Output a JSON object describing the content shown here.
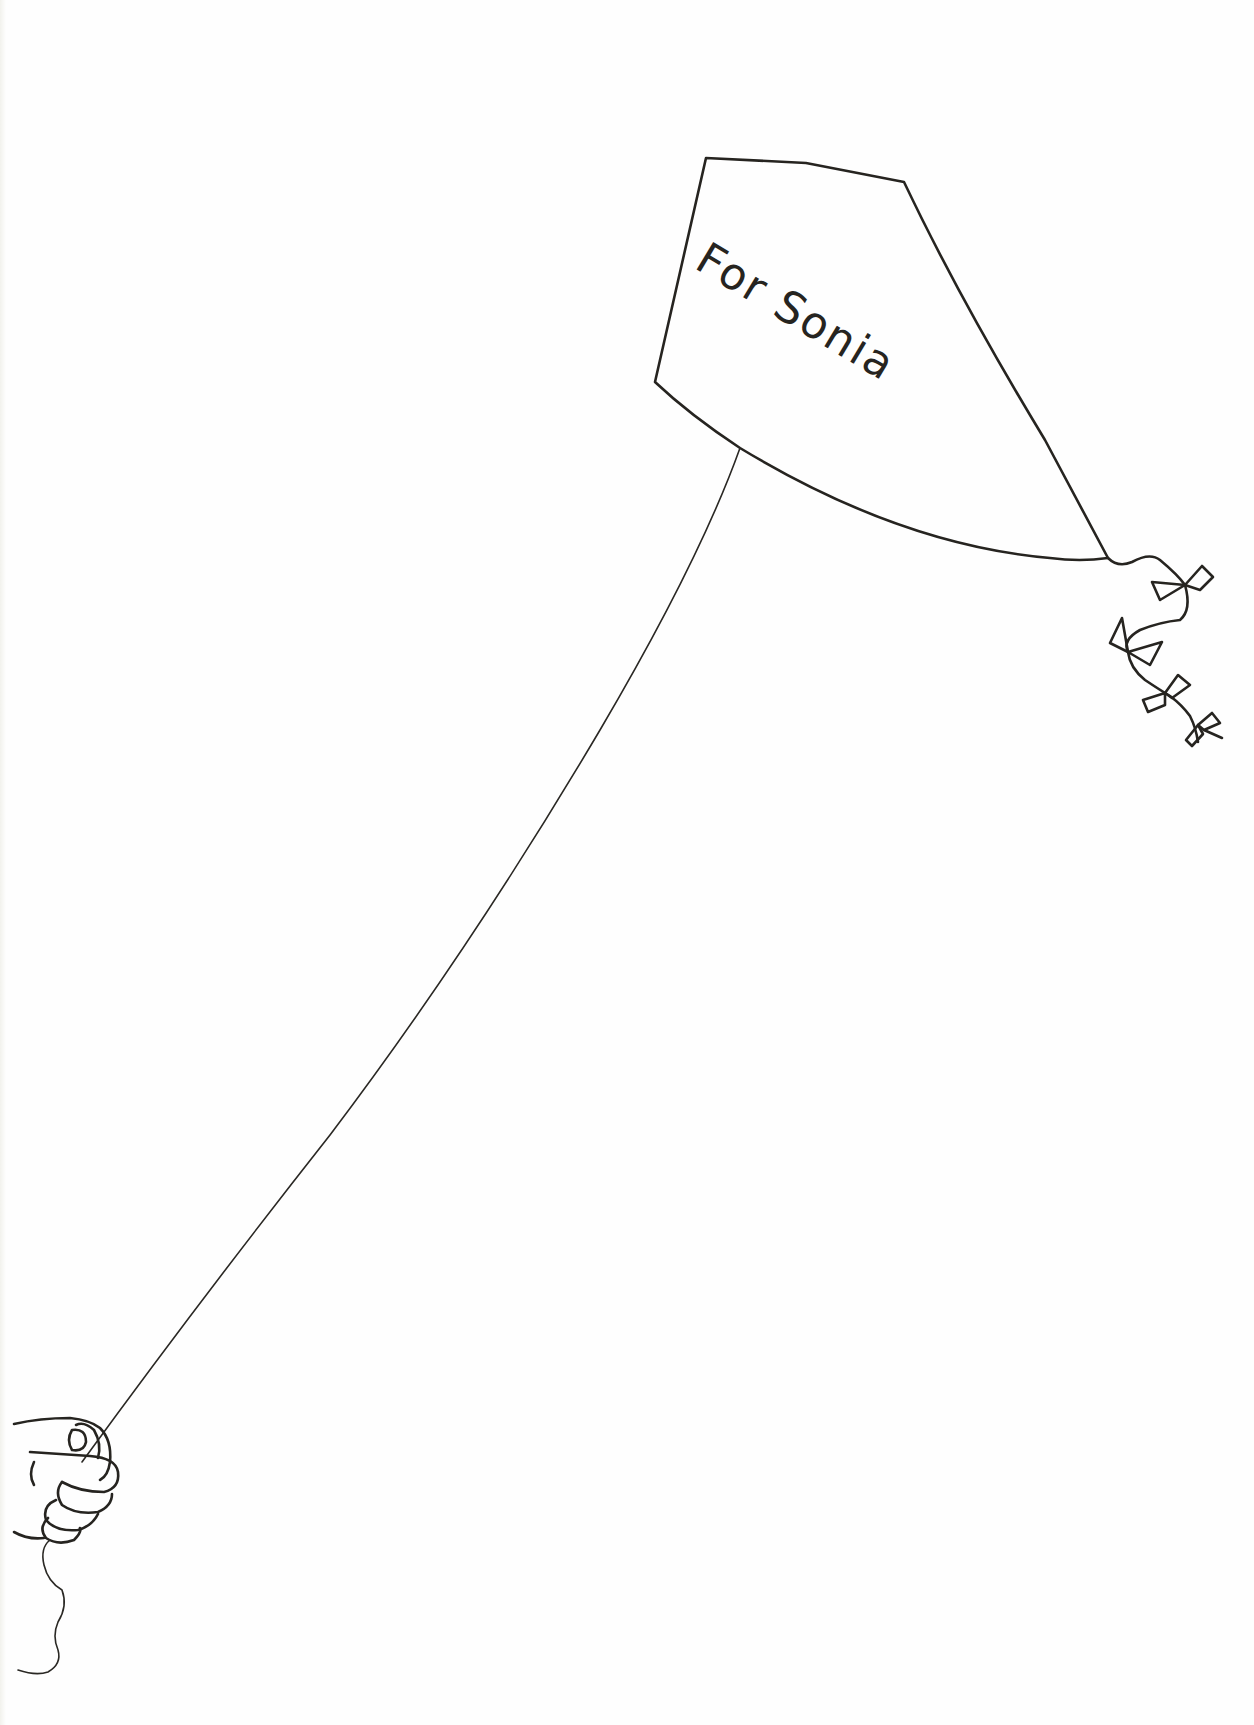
{
  "page": {
    "type": "dedication-illustration",
    "dedication_text": "For Sonia"
  },
  "illustration": {
    "kite": {
      "label": "kite",
      "tail_bows": 4
    },
    "string": {
      "label": "kite-string"
    },
    "hand": {
      "label": "hand-holding-string"
    }
  },
  "colors": {
    "ink": "#262420",
    "paper": "#fefefe"
  }
}
